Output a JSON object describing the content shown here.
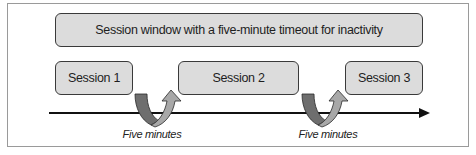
{
  "diagram": {
    "window_label": "Session window with a five-minute timeout for inactivity",
    "sessions": [
      {
        "label": "Session 1"
      },
      {
        "label": "Session 2"
      },
      {
        "label": "Session 3"
      }
    ],
    "gaps": [
      {
        "label": "Five minutes"
      },
      {
        "label": "Five minutes"
      }
    ],
    "timeline": {
      "direction": "left-to-right"
    },
    "colors": {
      "box_fill": "#dcdcdc",
      "box_border": "#3a3a3a",
      "arrow_dark": "#6e6e6e",
      "arrow_light": "#a8a8a8",
      "timeline": "#111111"
    }
  }
}
